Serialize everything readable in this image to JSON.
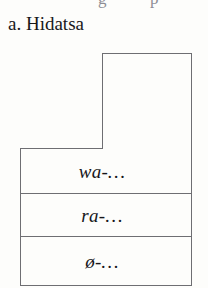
{
  "figure": {
    "caption": "a. Hidatsa",
    "clipped_line_above": {
      "fragment_1": "g",
      "fragment_2": "p"
    },
    "colors": {
      "background": "#fdfdfb",
      "stroke": "#6e6e72",
      "text": "#16161a"
    },
    "shape": {
      "description": "stepped rectangle outline with a tall upper-right column",
      "outer_left": 20,
      "outer_right": 191,
      "outer_bottom": 285,
      "column_top": 53,
      "step_x": 102,
      "step_y": 148
    },
    "rows": [
      {
        "id": "row-wa",
        "label": "wa-…",
        "morph": "wa-",
        "top": 148,
        "bottom": 193
      },
      {
        "id": "row-ra",
        "label": "ra-…",
        "morph": "ra-",
        "top": 193,
        "bottom": 236
      },
      {
        "id": "row-zero",
        "label": "ø-…",
        "morph": "ø-",
        "top": 236,
        "bottom": 285
      }
    ]
  }
}
